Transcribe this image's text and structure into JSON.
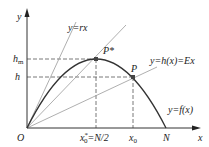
{
  "diagram": {
    "axes": {
      "x_label": "x",
      "y_label": "y",
      "origin_label": "O"
    },
    "curve": {
      "label": "y=f(x)",
      "type": "parabola",
      "color": "#333333"
    },
    "lines": [
      {
        "label": "y=rx",
        "color": "#999999"
      },
      {
        "label": "",
        "color": "#999999"
      },
      {
        "label": "y=h(x)=Ex",
        "color": "#999999"
      }
    ],
    "points": {
      "p_star": "P*",
      "p": "P"
    },
    "y_ticks": {
      "hm": "h",
      "hm_sub": "m",
      "h": "h"
    },
    "x_ticks": {
      "x0_star": "x",
      "x0_star_sub": "0",
      "x0_star_sup": "*",
      "x0_star_eq": "=N/2",
      "x0": "x",
      "x0_sub": "0",
      "N": "N"
    }
  }
}
